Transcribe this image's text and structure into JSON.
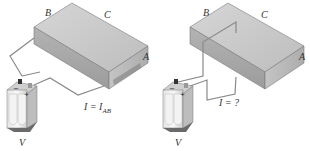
{
  "panels": [
    {
      "id": "left",
      "corner_labels": {
        "B": "B",
        "C": "C",
        "A": "A"
      },
      "current_label": "I = ",
      "current_sym": "I",
      "current_sub": "AB",
      "battery_label": "V",
      "battery_minus": "−",
      "battery_plus": "+"
    },
    {
      "id": "right",
      "corner_labels": {
        "B": "B",
        "C": "C",
        "A": "A"
      },
      "current_label": "I = ?",
      "battery_label": "V",
      "battery_minus": "−",
      "battery_plus": "+"
    }
  ],
  "colors": {
    "box_top": "#c8c8c8",
    "box_front": "#a9a9a9",
    "box_side": "#b8b8b8",
    "wire": "#8a8a8a",
    "battery_body": "#dcdcdc",
    "battery_dark": "#6a6a6a"
  }
}
